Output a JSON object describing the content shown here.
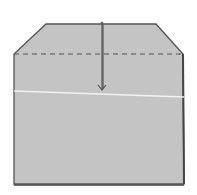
{
  "diagram": {
    "type": "origami-fold-step",
    "colors": {
      "background": "#ffffff",
      "paper_fill": "#c4c4c4",
      "outline": "#555555",
      "dashed_line": "#555555",
      "crease": "#f2f2f2",
      "arrow": "#555555"
    },
    "shape_points": "46,24 156,24 183,54 184,184 14,184 14,54",
    "dashed_fold_line": {
      "x1": 14,
      "y1": 54,
      "x2": 183,
      "y2": 54
    },
    "crease_line": {
      "x1": 14,
      "y1": 91,
      "x2": 184,
      "y2": 97
    },
    "arrow": {
      "x": 102,
      "y1": 22,
      "y2": 90
    }
  }
}
